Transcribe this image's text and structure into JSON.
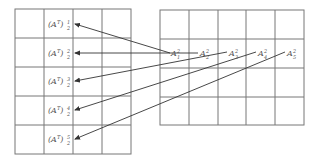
{
  "diagram": {
    "left_matrix": {
      "name": "A transpose matrix",
      "rows": 5,
      "cols": 4,
      "labels": [
        {
          "base": "(A",
          "sup_T": "T",
          "close": ")",
          "sup": "1",
          "sub": "2"
        },
        {
          "base": "(A",
          "sup_T": "T",
          "close": ")",
          "sup": "2",
          "sub": "2"
        },
        {
          "base": "(A",
          "sup_T": "T",
          "close": ")",
          "sup": "3",
          "sub": "2"
        },
        {
          "base": "(A",
          "sup_T": "T",
          "close": ")",
          "sup": "4",
          "sub": "2"
        },
        {
          "base": "(A",
          "sup_T": "T",
          "close": ")",
          "sup": "5",
          "sub": "2"
        }
      ]
    },
    "right_matrix": {
      "name": "A matrix",
      "rows": 4,
      "cols": 5,
      "labels": [
        {
          "base": "A",
          "sup": "2",
          "sub": "1"
        },
        {
          "base": "A",
          "sup": "2",
          "sub": "2"
        },
        {
          "base": "A",
          "sup": "2",
          "sub": "3"
        },
        {
          "base": "A",
          "sup": "2",
          "sub": "4"
        },
        {
          "base": "A",
          "sup": "2",
          "sub": "5"
        }
      ]
    },
    "colors": {
      "grid": "#777777",
      "arrow": "#333333",
      "text": "#555555",
      "background": "#ffffff"
    }
  }
}
